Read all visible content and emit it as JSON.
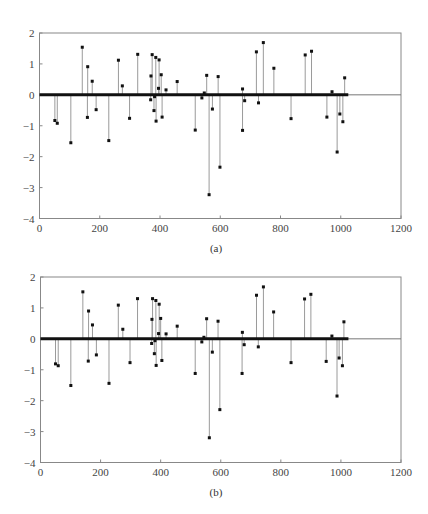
{
  "chart_data": [
    {
      "type": "stem",
      "id": "a",
      "caption": "(a)",
      "title": "",
      "xlabel": "",
      "ylabel": "",
      "xlim": [
        0,
        1200
      ],
      "ylim": [
        -4,
        2
      ],
      "xticks": [
        0,
        200,
        400,
        600,
        800,
        1000,
        1200
      ],
      "yticks": [
        2,
        1,
        0,
        -1,
        -2,
        -3,
        -4
      ],
      "grid": false,
      "legend": null,
      "baseline_extent": [
        0,
        1025
      ],
      "points": [
        [
          51,
          -0.83
        ],
        [
          59,
          -0.92
        ],
        [
          104,
          -1.55
        ],
        [
          142,
          1.54
        ],
        [
          160,
          0.91
        ],
        [
          159,
          -0.73
        ],
        [
          175,
          0.44
        ],
        [
          188,
          -0.48
        ],
        [
          230,
          -1.48
        ],
        [
          262,
          1.12
        ],
        [
          275,
          0.29
        ],
        [
          299,
          -0.76
        ],
        [
          326,
          1.31
        ],
        [
          369,
          -0.16
        ],
        [
          370,
          0.61
        ],
        [
          374,
          1.3
        ],
        [
          380,
          -0.51
        ],
        [
          382,
          -0.06
        ],
        [
          386,
          1.21
        ],
        [
          387,
          -0.85
        ],
        [
          395,
          0.21
        ],
        [
          397,
          1.13
        ],
        [
          404,
          0.65
        ],
        [
          407,
          -0.72
        ],
        [
          420,
          0.16
        ],
        [
          457,
          0.43
        ],
        [
          517,
          -1.14
        ],
        [
          539,
          -0.1
        ],
        [
          547,
          0.06
        ],
        [
          555,
          0.63
        ],
        [
          563,
          -3.23
        ],
        [
          574,
          -0.46
        ],
        [
          593,
          0.59
        ],
        [
          599,
          -2.34
        ],
        [
          674,
          0.19
        ],
        [
          674,
          -1.15
        ],
        [
          681,
          -0.19
        ],
        [
          720,
          1.39
        ],
        [
          727,
          -0.26
        ],
        [
          743,
          1.69
        ],
        [
          778,
          0.86
        ],
        [
          835,
          -0.77
        ],
        [
          882,
          1.29
        ],
        [
          903,
          1.41
        ],
        [
          954,
          -0.72
        ],
        [
          971,
          0.1
        ],
        [
          988,
          -1.85
        ],
        [
          997,
          -0.62
        ],
        [
          1007,
          -0.87
        ],
        [
          1013,
          0.55
        ]
      ]
    },
    {
      "type": "stem",
      "id": "b",
      "caption": "(b)",
      "title": "",
      "xlabel": "",
      "ylabel": "",
      "xlim": [
        0,
        1200
      ],
      "ylim": [
        -4,
        2
      ],
      "xticks": [
        0,
        200,
        400,
        600,
        800,
        1000,
        1200
      ],
      "yticks": [
        2,
        1,
        0,
        -1,
        -2,
        -3,
        -4
      ],
      "grid": false,
      "legend": null,
      "baseline_extent": [
        0,
        1025
      ],
      "points": [
        [
          50,
          -0.81
        ],
        [
          59,
          -0.87
        ],
        [
          101,
          -1.51
        ],
        [
          141,
          1.52
        ],
        [
          160,
          0.9
        ],
        [
          159,
          -0.72
        ],
        [
          173,
          0.45
        ],
        [
          186,
          -0.52
        ],
        [
          228,
          -1.44
        ],
        [
          259,
          1.09
        ],
        [
          274,
          0.31
        ],
        [
          298,
          -0.77
        ],
        [
          323,
          1.3
        ],
        [
          370,
          -0.15
        ],
        [
          371,
          0.63
        ],
        [
          373,
          1.3
        ],
        [
          379,
          -0.48
        ],
        [
          381,
          -0.06
        ],
        [
          384,
          1.24
        ],
        [
          385,
          -0.86
        ],
        [
          393,
          0.17
        ],
        [
          395,
          1.12
        ],
        [
          400,
          0.66
        ],
        [
          404,
          -0.7
        ],
        [
          418,
          0.16
        ],
        [
          455,
          0.41
        ],
        [
          515,
          -1.12
        ],
        [
          537,
          -0.1
        ],
        [
          544,
          0.05
        ],
        [
          553,
          0.65
        ],
        [
          562,
          -3.2
        ],
        [
          572,
          -0.43
        ],
        [
          591,
          0.57
        ],
        [
          597,
          -2.29
        ],
        [
          672,
          0.21
        ],
        [
          671,
          -1.12
        ],
        [
          678,
          -0.19
        ],
        [
          719,
          1.41
        ],
        [
          725,
          -0.26
        ],
        [
          742,
          1.68
        ],
        [
          776,
          0.87
        ],
        [
          834,
          -0.77
        ],
        [
          879,
          1.29
        ],
        [
          900,
          1.44
        ],
        [
          951,
          -0.73
        ],
        [
          970,
          0.09
        ],
        [
          987,
          -1.85
        ],
        [
          994,
          -0.62
        ],
        [
          1005,
          -0.87
        ],
        [
          1010,
          0.55
        ]
      ]
    }
  ],
  "figures": [
    {
      "caption": "(a)"
    },
    {
      "caption": "(b)"
    }
  ],
  "style": {
    "frame_color": "#888888",
    "stem_color": "#9a9a9a",
    "marker_color": "#111111",
    "baseline_color": "#111111",
    "zero_line_color": "#777777"
  }
}
